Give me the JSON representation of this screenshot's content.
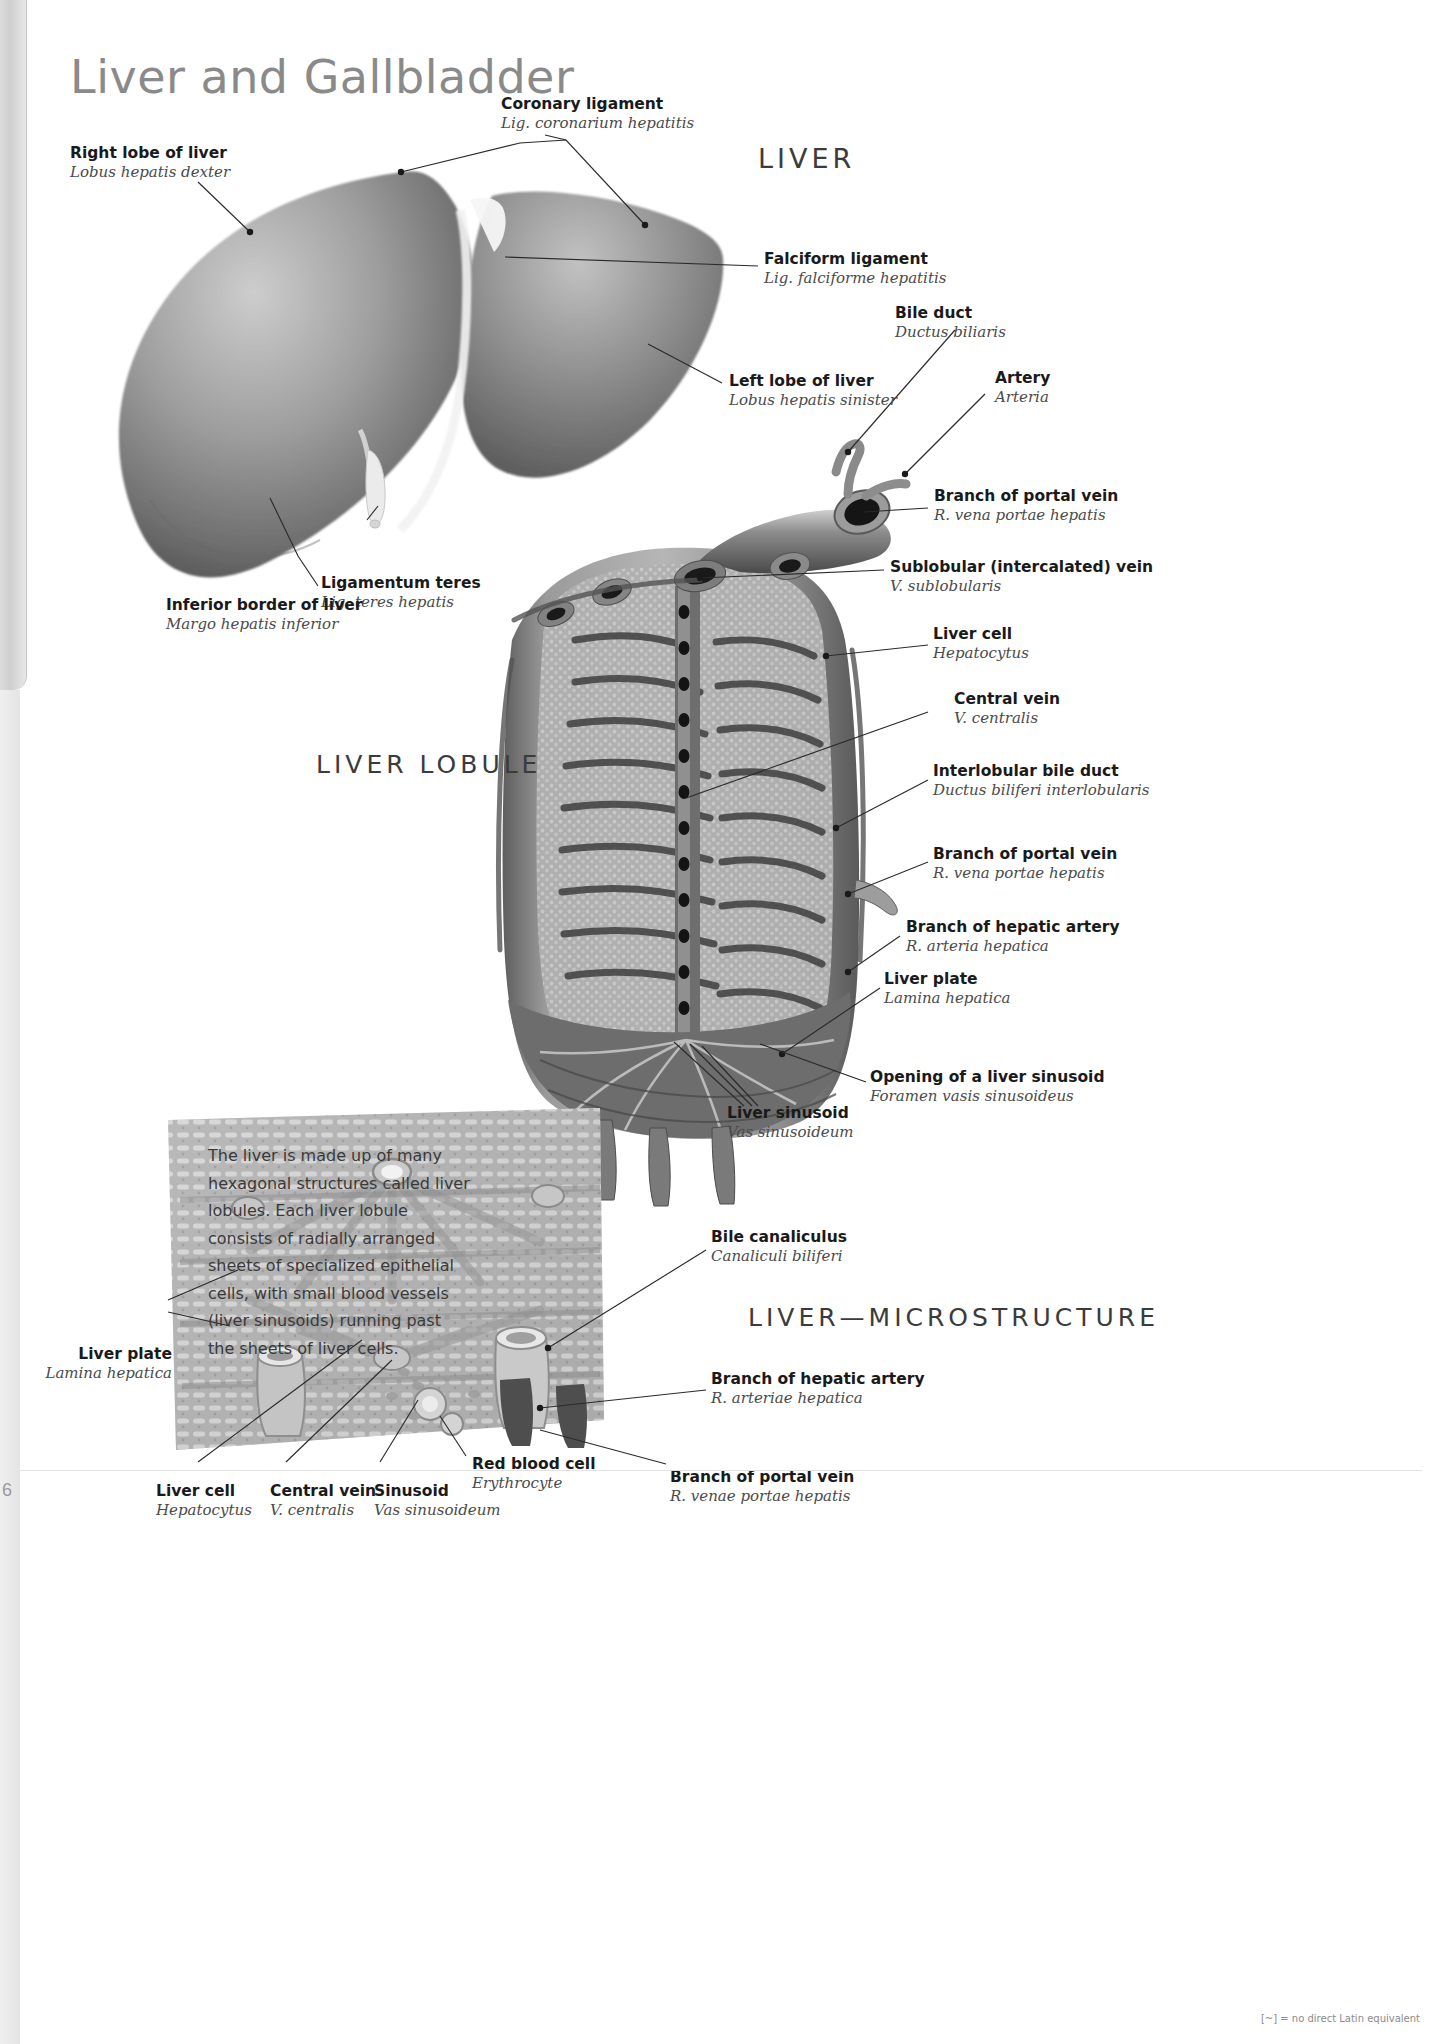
{
  "page": {
    "title": "Liver and Gallbladder",
    "folio": "6",
    "footnote": "[~] = no direct Latin equivalent"
  },
  "sections": {
    "liver": "LIVER",
    "lobule": "LIVER LOBULE",
    "microstructure": "LIVER—MICROSTRUCTURE"
  },
  "body_text": "The liver is made up of many hexagonal structures called liver lobules. Each liver lobule consists of radially arranged sheets of specialized epithelial cells, with small blood vessels (liver sinusoids) running past the sheets of liver cells.",
  "labels": {
    "liver_diagram": [
      {
        "en": "Right lobe of liver",
        "la": "Lobus hepatis dexter"
      },
      {
        "en": "Coronary ligament",
        "la": "Lig. coronarium hepatitis"
      },
      {
        "en": "Falciform ligament",
        "la": "Lig. falciforme hepatitis"
      },
      {
        "en": "Left lobe of liver",
        "la": "Lobus hepatis sinister"
      },
      {
        "en": "Ligamentum teres",
        "la": "Lig. teres hepatis"
      },
      {
        "en": "Inferior border of liver",
        "la": "Margo hepatis inferior"
      }
    ],
    "lobule_diagram": [
      {
        "en": "Bile duct",
        "la": "Ductus biliaris"
      },
      {
        "en": "Artery",
        "la": "Arteria"
      },
      {
        "en": "Branch of portal vein",
        "la": "R. vena portae hepatis"
      },
      {
        "en": "Sublobular (intercalated) vein",
        "la": "V. sublobularis"
      },
      {
        "en": "Liver cell",
        "la": "Hepatocytus"
      },
      {
        "en": "Central vein",
        "la": "V. centralis"
      },
      {
        "en": "Interlobular bile duct",
        "la": "Ductus biliferi interlobularis"
      },
      {
        "en": "Branch of portal vein",
        "la": "R. vena portae hepatis"
      },
      {
        "en": "Branch of hepatic artery",
        "la": "R. arteria hepatica"
      },
      {
        "en": "Liver plate",
        "la": "Lamina hepatica"
      },
      {
        "en": "Opening of a liver sinusoid",
        "la": "Foramen vasis sinusoideus"
      },
      {
        "en": "Liver sinusoid",
        "la": "Vas sinusoideum"
      }
    ],
    "microstructure_diagram": [
      {
        "en": "Bile canaliculus",
        "la": "Canaliculi biliferi"
      },
      {
        "en": "Branch of hepatic artery",
        "la": "R. arteriae hepatica"
      },
      {
        "en": "Liver plate",
        "la": "Lamina hepatica"
      },
      {
        "en": "Liver cell",
        "la": "Hepatocytus"
      },
      {
        "en": "Central vein",
        "la": "V. centralis"
      },
      {
        "en": "Sinusoid",
        "la": "Vas sinusoideum"
      },
      {
        "en": "Red blood cell",
        "la": "Erythrocyte"
      },
      {
        "en": "Branch of portal vein",
        "la": "R. venae portae hepatis"
      }
    ]
  },
  "colors": {
    "title": "#8a8a8a",
    "label_en": "#1a1a1a",
    "label_la": "#4a4a4a",
    "leader": "#2b2b2b"
  }
}
